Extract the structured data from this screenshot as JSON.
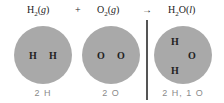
{
  "equation": {
    "reactant1": {
      "base": "H",
      "sub": "2",
      "state": "g"
    },
    "plus": "+",
    "reactant2": {
      "base": "O",
      "sub": "2",
      "state": "g"
    },
    "arrow": "→",
    "product": {
      "base1": "H",
      "sub": "2",
      "base2": "O",
      "state": "l"
    }
  },
  "circles": [
    {
      "atoms": [
        "H",
        "H"
      ],
      "label": "2 H"
    },
    {
      "atoms": [
        "O",
        "O"
      ],
      "label": "2 O"
    },
    {
      "atoms": [
        "H",
        "O",
        "H"
      ],
      "label": "2 H, 1 O"
    }
  ],
  "colors": {
    "circle": "#a9a9a9",
    "label": "#8a8a8a",
    "divider": "#555555"
  }
}
